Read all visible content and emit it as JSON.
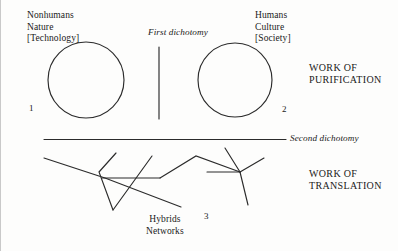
{
  "diagram": {
    "labels": {
      "nonhumans": "Nonhumans\nNature\n[Technology]",
      "humans": "Humans\nCulture\n[Society]",
      "first_dichotomy": "First dichotomy",
      "second_dichotomy": "Second dichotomy",
      "work_of_purification": "WORK OF\nPURIFICATION",
      "work_of_translation": "WORK OF\nTRANSLATION",
      "hybrids_networks": "Hybrids\nNetworks",
      "marker_one": "1",
      "marker_two": "2",
      "marker_three": "3"
    },
    "colors": {
      "stroke": "#2b2b2b",
      "background": "#fdfdfc",
      "text": "#1a1a1a",
      "frame": "#c9c9c9"
    }
  }
}
